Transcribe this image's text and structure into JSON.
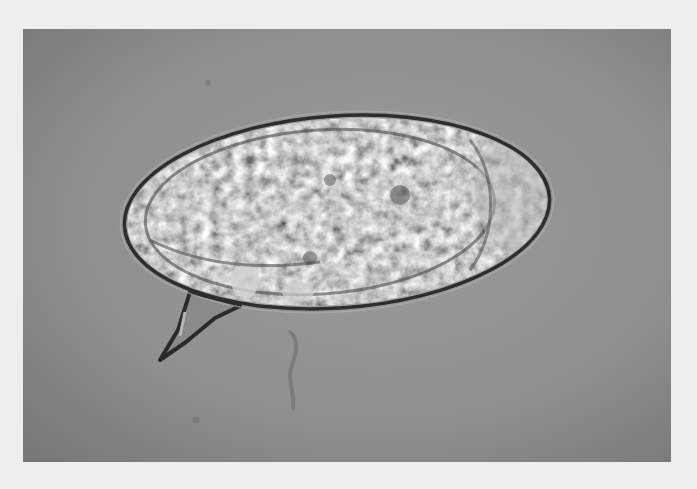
{
  "image": {
    "alt": "Brightfield micrograph of an oval parasite egg with a prominent lateral spine, on a grey background",
    "subject": "egg-with-lateral-spine",
    "colors": {
      "page_border": "#eeeeee",
      "background": "#939393",
      "background_edge": "#7c7c7c",
      "egg_shell": "#2e2e2e",
      "egg_interior": "#9c9c9c",
      "egg_highlight": "#c8c8c8",
      "egg_dark_speckle": "#5a5a5a"
    },
    "egg": {
      "center_x": 337,
      "center_y": 212,
      "rx": 213,
      "ry": 96,
      "rotation_deg": -4
    },
    "spine": {
      "tip": [
        160,
        360
      ],
      "base_left": [
        192,
        295
      ],
      "base_right": [
        238,
        305
      ]
    }
  }
}
